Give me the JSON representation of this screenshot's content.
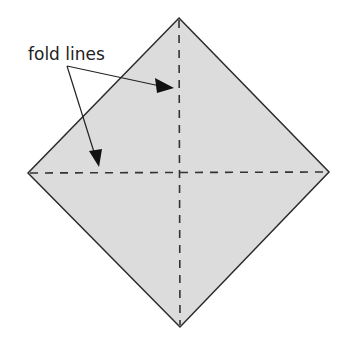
{
  "diagram": {
    "label": "fold lines",
    "colors": {
      "paper_fill": "#dcdcdc",
      "outline": "#2a2a2a",
      "fold_line": "#333333"
    },
    "shape": "square rotated 45 degrees (diamond)",
    "fold_lines": [
      "vertical diagonal",
      "horizontal diagonal"
    ]
  }
}
